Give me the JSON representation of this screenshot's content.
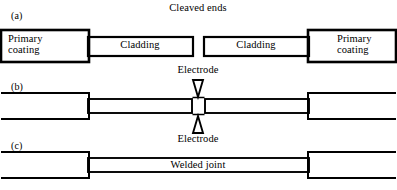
{
  "figure": {
    "stroke_color": "#000000",
    "background_color": "#ffffff"
  },
  "panels": [
    {
      "id": "a",
      "letter": "(a)",
      "caption": "Cleaved ends",
      "labels": {
        "left_coating": "Primary\ncoating",
        "left_cladding": "Cladding",
        "right_cladding": "Cladding",
        "right_coating": "Primary\ncoating"
      }
    },
    {
      "id": "b",
      "letter": "(b)",
      "labels": {
        "electrode_top": "Electrode",
        "electrode_bottom": "Electrode"
      }
    },
    {
      "id": "c",
      "letter": "(c)",
      "labels": {
        "joint": "Welded joint"
      }
    }
  ]
}
